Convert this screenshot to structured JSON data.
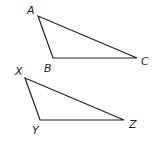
{
  "figure": {
    "stroke_color": "#231f20",
    "background": "#ffffff",
    "triangles": [
      {
        "name": "ABC",
        "vertices": [
          {
            "label": "A",
            "x": 38,
            "y": 16,
            "label_x": 27,
            "label_y": 14
          },
          {
            "label": "B",
            "x": 53,
            "y": 58,
            "label_x": 44,
            "label_y": 72
          },
          {
            "label": "C",
            "x": 137,
            "y": 58,
            "label_x": 141,
            "label_y": 65
          }
        ]
      },
      {
        "name": "XYZ",
        "vertices": [
          {
            "label": "X",
            "x": 25,
            "y": 78,
            "label_x": 15,
            "label_y": 75
          },
          {
            "label": "Y",
            "x": 40,
            "y": 120,
            "label_x": 32,
            "label_y": 134
          },
          {
            "label": "Z",
            "x": 124,
            "y": 120,
            "label_x": 129,
            "label_y": 128
          }
        ]
      }
    ]
  }
}
